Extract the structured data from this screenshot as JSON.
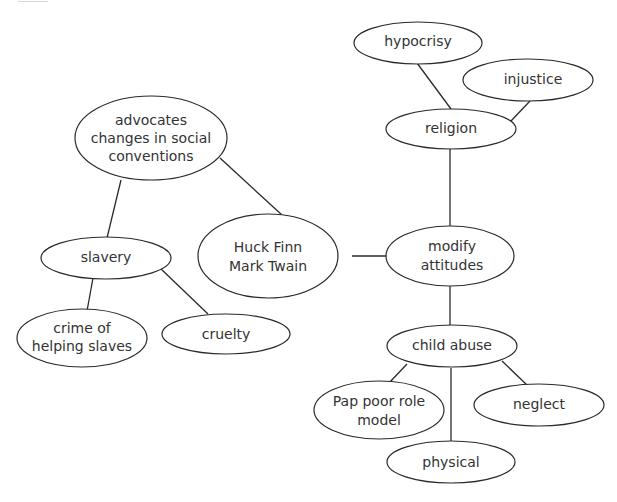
{
  "diagram": {
    "type": "concept-map",
    "nodes": {
      "huck": {
        "lines": [
          "Huck Finn",
          "Mark Twain"
        ]
      },
      "advocates": {
        "lines": [
          "advocates",
          "changes in social",
          "conventions"
        ]
      },
      "slavery": {
        "lines": [
          "slavery"
        ]
      },
      "crime": {
        "lines": [
          "crime of",
          "helping slaves"
        ]
      },
      "cruelty": {
        "lines": [
          "cruelty"
        ]
      },
      "modify": {
        "lines": [
          "modify",
          "attitudes"
        ]
      },
      "religion": {
        "lines": [
          "religion"
        ]
      },
      "hypocrisy": {
        "lines": [
          "hypocrisy"
        ]
      },
      "injustice": {
        "lines": [
          "injustice"
        ]
      },
      "child_abuse": {
        "lines": [
          "child abuse"
        ]
      },
      "pap": {
        "lines": [
          "Pap poor role",
          "model"
        ]
      },
      "neglect": {
        "lines": [
          "neglect"
        ]
      },
      "physical": {
        "lines": [
          "physical"
        ]
      }
    },
    "edges": [
      [
        "advocates",
        "huck"
      ],
      [
        "advocates",
        "slavery"
      ],
      [
        "slavery",
        "crime"
      ],
      [
        "slavery",
        "cruelty"
      ],
      [
        "huck",
        "modify"
      ],
      [
        "modify",
        "religion"
      ],
      [
        "religion",
        "hypocrisy"
      ],
      [
        "religion",
        "injustice"
      ],
      [
        "modify",
        "child_abuse"
      ],
      [
        "child_abuse",
        "pap"
      ],
      [
        "child_abuse",
        "neglect"
      ],
      [
        "child_abuse",
        "physical"
      ]
    ]
  }
}
